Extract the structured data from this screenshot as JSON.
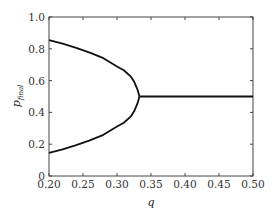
{
  "chart_data": {
    "type": "line",
    "title": "",
    "xlabel": "q",
    "ylabel": "p",
    "ylabel_subscript": "final",
    "xlim": [
      0.2,
      0.5
    ],
    "ylim": [
      0,
      1.0
    ],
    "xticks": [
      "0.20",
      "0.25",
      "0.30",
      "0.35",
      "0.40",
      "0.45",
      "0.50"
    ],
    "yticks": [
      "0",
      "0.2",
      "0.4",
      "0.6",
      "0.8",
      "1.0"
    ],
    "grid": false,
    "legend": null,
    "bifurcation_point": {
      "q": 0.333,
      "p": 0.5
    },
    "series": [
      {
        "name": "upper branch",
        "x": [
          0.2,
          0.22,
          0.24,
          0.26,
          0.28,
          0.3,
          0.31,
          0.32,
          0.325,
          0.33,
          0.333
        ],
        "y": [
          0.854,
          0.832,
          0.806,
          0.776,
          0.741,
          0.689,
          0.665,
          0.627,
          0.595,
          0.545,
          0.5
        ]
      },
      {
        "name": "lower branch",
        "x": [
          0.2,
          0.22,
          0.24,
          0.26,
          0.28,
          0.3,
          0.31,
          0.32,
          0.325,
          0.33,
          0.333
        ],
        "y": [
          0.146,
          0.168,
          0.194,
          0.224,
          0.259,
          0.311,
          0.335,
          0.373,
          0.405,
          0.455,
          0.5
        ]
      },
      {
        "name": "single branch",
        "x": [
          0.333,
          0.5
        ],
        "y": [
          0.5,
          0.5
        ]
      }
    ]
  }
}
